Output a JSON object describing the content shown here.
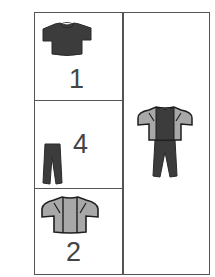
{
  "figure": {
    "colors": {
      "border": "#555555",
      "dark_garment": "#3c3c3c",
      "light_garment": "#a8a8a8",
      "number": "#444444"
    },
    "left_cells": [
      {
        "item": "t-shirt",
        "number": "1"
      },
      {
        "item": "trousers",
        "number": "4"
      },
      {
        "item": "jacket",
        "number": "2"
      }
    ],
    "right_cell": {
      "item": "outfit: jacket over t-shirt with trousers"
    }
  }
}
